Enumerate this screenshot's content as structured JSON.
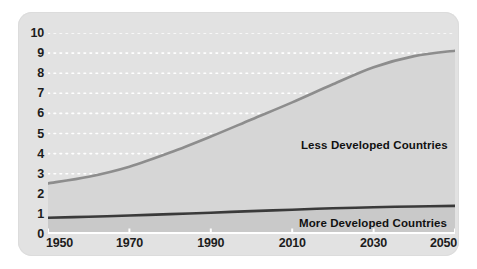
{
  "chart_data": {
    "type": "area",
    "title": "",
    "subtitle": "",
    "xlabel": "",
    "ylabel": "",
    "x": [
      1950,
      1960,
      1970,
      1980,
      1990,
      2000,
      2010,
      2020,
      2030,
      2040,
      2050
    ],
    "xlim": [
      1950,
      2050
    ],
    "ylim": [
      0,
      10
    ],
    "grid": true,
    "legend_position": "inline-annotations",
    "xticks": [
      "1950",
      "1970",
      "1990",
      "2010",
      "2030",
      "2050"
    ],
    "xtick_values": [
      1950,
      1970,
      1990,
      2010,
      2030,
      2050
    ],
    "yticks": [
      "0",
      "1",
      "2",
      "3",
      "4",
      "5",
      "6",
      "7",
      "8",
      "9",
      "10"
    ],
    "ytick_values": [
      0,
      1,
      2,
      3,
      4,
      5,
      6,
      7,
      8,
      9,
      10
    ],
    "series": [
      {
        "name": "More Developed Countries",
        "color": "#3a3a3a",
        "fill": "#c9c9c9",
        "values": [
          0.81,
          0.86,
          0.92,
          0.99,
          1.06,
          1.14,
          1.21,
          1.28,
          1.33,
          1.37,
          1.4
        ]
      },
      {
        "name": "Less Developed Countries",
        "color": "#8d8d8d",
        "fill": "#d6d6d6",
        "values": [
          2.52,
          2.85,
          3.35,
          4.05,
          4.85,
          5.7,
          6.55,
          7.45,
          8.3,
          8.85,
          9.12
        ]
      }
    ],
    "annotations": [
      {
        "text": "Less Developed Countries",
        "x": 2022,
        "y": 5.1
      },
      {
        "text": "More Developed Countries",
        "x": 2022,
        "y": 1.0
      }
    ]
  },
  "axes": {
    "y_ticks": [
      "10",
      "9",
      "8",
      "7",
      "6",
      "5",
      "4",
      "3",
      "2",
      "1",
      "0"
    ],
    "x_ticks": [
      "1950",
      "1970",
      "1990",
      "2010",
      "2030",
      "2050"
    ]
  },
  "captions": {
    "less_developed": "Less Developed Countries",
    "more_developed": "More Developed Countries"
  },
  "colors": {
    "panel_background": "#e2e2e2",
    "plot_background": "#e2e2e2",
    "gridline": "#ffffff",
    "upper_band_fill": "#d6d6d6",
    "upper_curve": "#8d8d8d",
    "lower_band_fill": "#c9c9c9",
    "lower_curve": "#3a3a3a",
    "axis_line": "#ffffff",
    "tick_label": "#1c1c1c"
  }
}
